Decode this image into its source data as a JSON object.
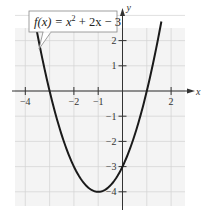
{
  "chart_data": {
    "type": "line",
    "title": "",
    "xlabel": "x",
    "ylabel": "y",
    "xlim": [
      -4.4,
      2.4
    ],
    "ylim": [
      -4.5,
      3.4
    ],
    "grid": true,
    "x_ticks": [
      -4,
      -2,
      -1,
      2
    ],
    "x_tick_labels": [
      "−4",
      "−2",
      "−1",
      "2"
    ],
    "y_ticks": [
      2,
      1,
      -1,
      -2,
      -3,
      -4
    ],
    "y_tick_labels": [
      "2",
      "1",
      "−1",
      "−2",
      "−3",
      "−4"
    ],
    "series": [
      {
        "name": "f(x) = x^2 + 2x - 3",
        "function": "x^2 + 2x - 3",
        "domain": [
          -3.55,
          1.6
        ],
        "key_points": [
          {
            "x": -3,
            "y": 0
          },
          {
            "x": -1,
            "y": -4
          },
          {
            "x": 0,
            "y": -3
          },
          {
            "x": 1,
            "y": 0
          }
        ]
      }
    ],
    "annotation": {
      "text_fx": "f(x) = x",
      "text_exp": "2",
      "text_rest": " + 2x − 3"
    }
  }
}
